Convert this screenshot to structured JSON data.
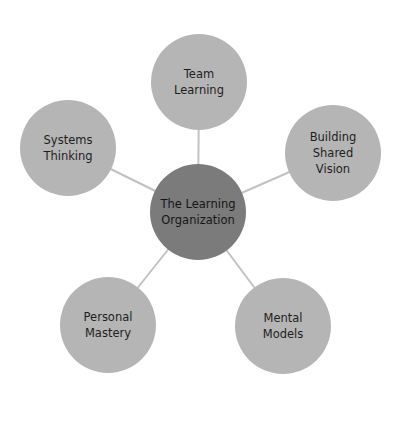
{
  "diagram": {
    "title": "The Learning Organization",
    "center": {
      "label": "The Learning\nOrganization",
      "x": 198,
      "y": 212,
      "color": "#7b7b7b"
    },
    "nodes": [
      {
        "id": "team-learning",
        "label": "Team\nLearning",
        "x": 199,
        "y": 82
      },
      {
        "id": "building-shared-vision",
        "label": "Building\nShared\nVision",
        "x": 333,
        "y": 153
      },
      {
        "id": "mental-models",
        "label": "Mental\nModels",
        "x": 283,
        "y": 326
      },
      {
        "id": "personal-mastery",
        "label": "Personal\nMastery",
        "x": 108,
        "y": 325
      },
      {
        "id": "systems-thinking",
        "label": "Systems\nThinking",
        "x": 68,
        "y": 148
      }
    ],
    "colors": {
      "node": "#b5b5b5",
      "center": "#7b7b7b",
      "connector": "#c2c2c2",
      "text": "#1e1e1e"
    }
  }
}
